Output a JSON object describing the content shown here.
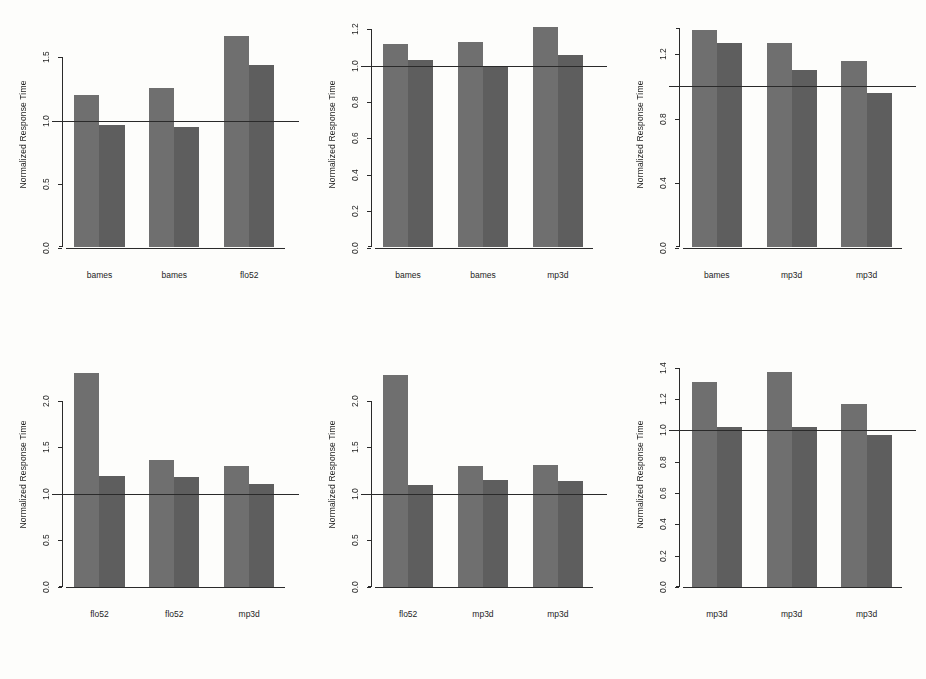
{
  "figure": {
    "background": "#fdfdfb",
    "bar_color_first": "#6f6f6f",
    "bar_color_second": "#5e5e5e",
    "axis_color": "#2a2a2a",
    "ylabel": "Normalized Response Time",
    "reference_line_value": 1.0
  },
  "chart_data": [
    {
      "id": "panel-1",
      "type": "bar",
      "title": "",
      "xlabel": "",
      "ylabel": "Normalized Response Time",
      "categories": [
        "bames",
        "bames",
        "flo52"
      ],
      "series": [
        {
          "name": "first",
          "values": [
            1.2,
            1.26,
            1.67
          ]
        },
        {
          "name": "second",
          "values": [
            0.97,
            0.95,
            1.44
          ]
        }
      ],
      "yticks": [
        0.0,
        0.5,
        1.0,
        1.5
      ],
      "yticklabels": [
        "0.0",
        "0.5",
        "1.0",
        "1.5"
      ],
      "ylim": [
        0.0,
        1.78
      ],
      "axis_top": 1.5,
      "reference_line": 1.0,
      "grid": false,
      "legend": "none"
    },
    {
      "id": "panel-2",
      "type": "bar",
      "title": "",
      "xlabel": "",
      "ylabel": "Normalized Response Time",
      "categories": [
        "bames",
        "bames",
        "mp3d"
      ],
      "series": [
        {
          "name": "first",
          "values": [
            1.12,
            1.13,
            1.21
          ]
        },
        {
          "name": "second",
          "values": [
            1.03,
            1.0,
            1.06
          ]
        }
      ],
      "yticks": [
        0.0,
        0.2,
        0.4,
        0.6,
        0.8,
        1.0,
        1.2
      ],
      "yticklabels": [
        "0.0",
        "0.2",
        "0.4",
        "0.6",
        "0.8",
        "1.0",
        "1.2"
      ],
      "ylim": [
        0.0,
        1.24
      ],
      "axis_top": 1.2,
      "reference_line": 1.0,
      "grid": false,
      "legend": "none"
    },
    {
      "id": "panel-3",
      "type": "bar",
      "title": "",
      "xlabel": "",
      "ylabel": "Normalized Response Time",
      "categories": [
        "bames",
        "mp3d",
        "mp3d"
      ],
      "series": [
        {
          "name": "first",
          "values": [
            1.35,
            1.27,
            1.16
          ]
        },
        {
          "name": "second",
          "values": [
            1.27,
            1.1,
            0.96
          ]
        }
      ],
      "yticks": [
        0.0,
        0.4,
        0.8,
        1.2
      ],
      "yticklabels": [
        "0.0",
        "0.4",
        "0.8",
        "1.2"
      ],
      "ylim": [
        0.0,
        1.4
      ],
      "axis_top": 1.36,
      "reference_line": 1.0,
      "grid": false,
      "legend": "none"
    },
    {
      "id": "panel-4",
      "type": "bar",
      "title": "",
      "xlabel": "",
      "ylabel": "Normalized Response Time",
      "categories": [
        "flo52",
        "flo52",
        "mp3d"
      ],
      "series": [
        {
          "name": "first",
          "values": [
            2.3,
            1.36,
            1.3
          ]
        },
        {
          "name": "second",
          "values": [
            1.19,
            1.18,
            1.11
          ]
        }
      ],
      "yticks": [
        0.0,
        0.5,
        1.0,
        1.5,
        2.0
      ],
      "yticklabels": [
        "0.0",
        "0.5",
        "1.0",
        "1.5",
        "2.0"
      ],
      "ylim": [
        0.0,
        2.42
      ],
      "axis_top": 2.0,
      "reference_line": 1.0,
      "grid": false,
      "legend": "none"
    },
    {
      "id": "panel-5",
      "type": "bar",
      "title": "",
      "xlabel": "",
      "ylabel": "Normalized Response Time",
      "categories": [
        "flo52",
        "mp3d",
        "mp3d"
      ],
      "series": [
        {
          "name": "first",
          "values": [
            2.28,
            1.3,
            1.31
          ]
        },
        {
          "name": "second",
          "values": [
            1.09,
            1.15,
            1.14
          ]
        }
      ],
      "yticks": [
        0.0,
        0.5,
        1.0,
        1.5,
        2.0
      ],
      "yticklabels": [
        "0.0",
        "0.5",
        "1.0",
        "1.5",
        "2.0"
      ],
      "ylim": [
        0.0,
        2.42
      ],
      "axis_top": 2.0,
      "reference_line": 1.0,
      "grid": false,
      "legend": "none"
    },
    {
      "id": "panel-6",
      "type": "bar",
      "title": "",
      "xlabel": "",
      "ylabel": "Normalized Response Time",
      "categories": [
        "mp3d",
        "mp3d",
        "mp3d"
      ],
      "series": [
        {
          "name": "first",
          "values": [
            1.31,
            1.37,
            1.17
          ]
        },
        {
          "name": "second",
          "values": [
            1.02,
            1.02,
            0.97
          ]
        }
      ],
      "yticks": [
        0.0,
        0.2,
        0.4,
        0.6,
        0.8,
        1.0,
        1.2,
        1.4
      ],
      "yticklabels": [
        "0.0",
        "0.2",
        "0.4",
        "0.6",
        "0.8",
        "1.0",
        "1.2",
        "1.4"
      ],
      "ylim": [
        0.0,
        1.44
      ],
      "axis_top": 1.4,
      "reference_line": 1.0,
      "grid": false,
      "legend": "none"
    }
  ]
}
